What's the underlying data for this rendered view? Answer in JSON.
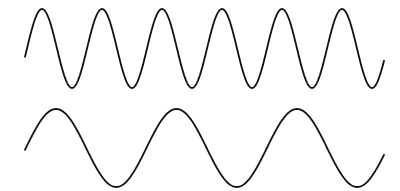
{
  "diagram": {
    "stroke_color": "#111111",
    "background_color": "#ffffff",
    "waves": [
      {
        "name": "high-frequency-wave",
        "cycles": 6,
        "relative_frequency": 2,
        "start_phase_deg": 210,
        "end_phase_deg": 2400
      },
      {
        "name": "low-frequency-wave",
        "cycles": 3,
        "relative_frequency": 1,
        "start_phase_deg": 210,
        "end_phase_deg": 1260
      }
    ]
  }
}
